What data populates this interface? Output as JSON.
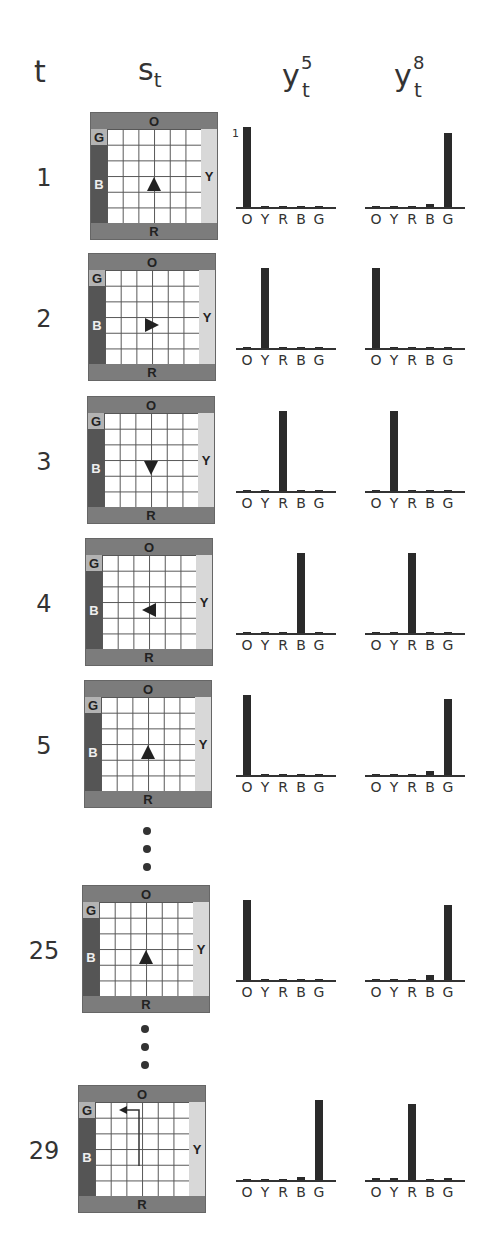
{
  "headers": {
    "t": "t",
    "s": "s",
    "s_sub": "t",
    "y5": "y",
    "y5_sup": "5",
    "y5_sub": "t",
    "y8": "y",
    "y8_sup": "8",
    "y8_sub": "t"
  },
  "wall_labels": {
    "top": "O",
    "bottom": "R",
    "left_top": "G",
    "left": "B",
    "right": "Y"
  },
  "colors": {
    "wall_O_R": "#7c7c7c",
    "wall_B": "#555555",
    "wall_Y": "#d8d8d8",
    "wall_G": "#b3b3b3",
    "bar": "#2a2a2a"
  },
  "categories": [
    "O",
    "Y",
    "R",
    "B",
    "G"
  ],
  "y_tick": "1",
  "rows": [
    {
      "t": "1",
      "agent": "up",
      "y5": [
        1.0,
        0,
        0,
        0,
        0
      ],
      "y8": [
        0,
        0,
        0,
        0.04,
        0.92
      ]
    },
    {
      "t": "2",
      "agent": "right",
      "y5": [
        0.01,
        1.0,
        0.01,
        0,
        0.01
      ],
      "y8": [
        1.0,
        0.01,
        0.01,
        0,
        0.01
      ]
    },
    {
      "t": "3",
      "agent": "down",
      "y5": [
        0.01,
        0.01,
        1.0,
        0.01,
        0.01
      ],
      "y8": [
        0.01,
        1.0,
        0.01,
        0.01,
        0.01
      ]
    },
    {
      "t": "4",
      "agent": "left",
      "y5": [
        0,
        0,
        0,
        1.0,
        0
      ],
      "y8": [
        0,
        0,
        1.0,
        0,
        0
      ]
    },
    {
      "t": "5",
      "agent": "up",
      "y5": [
        1.0,
        0,
        0,
        0,
        0
      ],
      "y8": [
        0,
        0,
        0,
        0.05,
        0.95
      ]
    },
    {
      "t": "25",
      "agent": "up",
      "y5": [
        1.0,
        0,
        0,
        0,
        0
      ],
      "y8": [
        0.01,
        0,
        0.01,
        0.06,
        0.94
      ]
    },
    {
      "t": "29",
      "agent": "path-up-left",
      "y5": [
        0,
        0,
        0,
        0.04,
        1.0
      ],
      "y8": [
        0.02,
        0.02,
        0.95,
        0.01,
        0.02
      ]
    }
  ],
  "chart_data": {
    "type": "bar",
    "categories": [
      "O",
      "Y",
      "R",
      "B",
      "G"
    ],
    "ylim": [
      0,
      1
    ],
    "series": [
      {
        "name": "y5_t1",
        "values": [
          1.0,
          0,
          0,
          0,
          0
        ]
      },
      {
        "name": "y8_t1",
        "values": [
          0,
          0,
          0,
          0.04,
          0.92
        ]
      },
      {
        "name": "y5_t2",
        "values": [
          0.01,
          1.0,
          0.01,
          0,
          0.01
        ]
      },
      {
        "name": "y8_t2",
        "values": [
          1.0,
          0.01,
          0.01,
          0,
          0.01
        ]
      },
      {
        "name": "y5_t3",
        "values": [
          0.01,
          0.01,
          1.0,
          0.01,
          0.01
        ]
      },
      {
        "name": "y8_t3",
        "values": [
          0.01,
          1.0,
          0.01,
          0.01,
          0.01
        ]
      },
      {
        "name": "y5_t4",
        "values": [
          0,
          0,
          0,
          1.0,
          0
        ]
      },
      {
        "name": "y8_t4",
        "values": [
          0,
          0,
          1.0,
          0,
          0
        ]
      },
      {
        "name": "y5_t5",
        "values": [
          1.0,
          0,
          0,
          0,
          0
        ]
      },
      {
        "name": "y8_t5",
        "values": [
          0,
          0,
          0,
          0.05,
          0.95
        ]
      },
      {
        "name": "y5_t25",
        "values": [
          1.0,
          0,
          0,
          0,
          0
        ]
      },
      {
        "name": "y8_t25",
        "values": [
          0.01,
          0,
          0.01,
          0.06,
          0.94
        ]
      },
      {
        "name": "y5_t29",
        "values": [
          0,
          0,
          0,
          0.04,
          1.0
        ]
      },
      {
        "name": "y8_t29",
        "values": [
          0.02,
          0.02,
          0.95,
          0.01,
          0.02
        ]
      }
    ]
  }
}
